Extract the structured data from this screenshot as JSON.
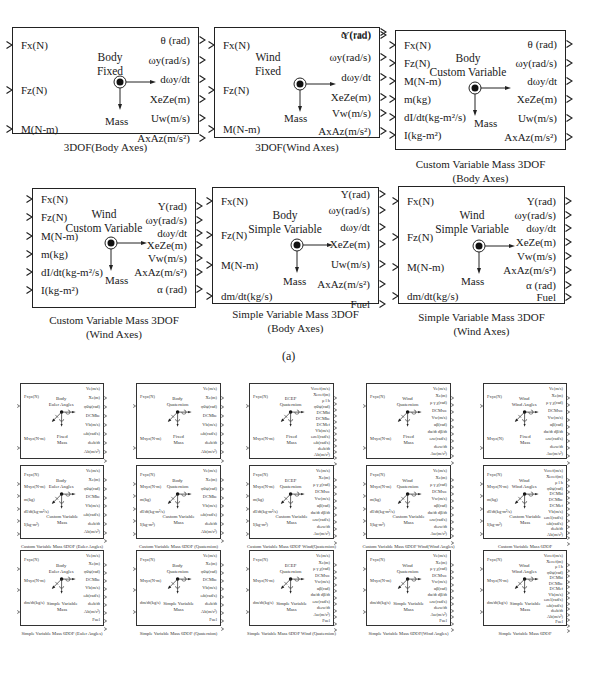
{
  "figure_label": "(a)",
  "blocks_3dof": [
    {
      "caption": [
        "3DOF(Body Axes)"
      ],
      "title": [
        "Body",
        "Fixed"
      ],
      "mass": "Mass",
      "inputs": [
        "Fx(N)",
        "Fz(N)",
        "M(N-m)"
      ],
      "outputs": [
        "θ (rad)",
        "ωy(rad/s)",
        "dωy/dt",
        "XeZe(m)",
        "Uw(m/s)",
        "AxAz(m/s²)"
      ]
    },
    {
      "caption": [
        "3DOF(Wind Axes)"
      ],
      "title": [
        "Wind",
        "Fixed"
      ],
      "mass": "Mass",
      "inputs": [
        "Fx(N)",
        "Fz(N)",
        "M(N-m)"
      ],
      "outputs": [
        "Y(rad)",
        "ωy(rad/s)",
        "dωy/dt",
        "XeZe(m)",
        "Vw(m/s)",
        "AxAz(m/s²)",
        "α (rad)"
      ]
    },
    {
      "caption": [
        "Custom Variable Mass 3DOF",
        "(Body Axes)"
      ],
      "title": [
        "Body",
        "Custom Variable"
      ],
      "mass": "Mass",
      "inputs": [
        "Fx(N)",
        "Fz(N)",
        "M(N-m)",
        "m(kg)",
        "dI/dt(kg-m²/s)",
        "I(kg-m²)"
      ],
      "outputs": [
        "θ (rad)",
        "ωy(rad/s)",
        "dωy/dt",
        "XeZe(m)",
        "Uw(m/s)",
        "AxAz(m/s²)"
      ]
    },
    {
      "caption": [
        "Custom Variable Mass 3DOF",
        "(Wind Axes)"
      ],
      "title": [
        "Wind",
        "Custom Variable"
      ],
      "mass": "Mass",
      "inputs": [
        "Fx(N)",
        "Fz(N)",
        "M(N-m)",
        "m(kg)",
        "dI/dt(kg-m²/s)",
        "I(kg-m²)"
      ],
      "outputs": [
        "Y(rad)",
        "ωy(rad/s)",
        "dωy/dt",
        "XeZe(m)",
        "Vw(m/s)",
        "AxAz(m/s²)",
        "α (rad)"
      ]
    },
    {
      "caption": [
        "Simple  Variable Mass 3DOF",
        "(Body Axes)"
      ],
      "title": [
        "Body",
        "Simple  Variable"
      ],
      "mass": "Mass",
      "inputs": [
        "Fx(N)",
        "Fz(N)",
        "M(N-m)",
        "dm/dt(kg/s)"
      ],
      "outputs": [
        "Y(rad)",
        "ωy(rad/s)",
        "dωy/dt",
        "XeZe(m)",
        "Uw(m/s)",
        "AxAz(m/s²)",
        "Fuel"
      ]
    },
    {
      "caption": [
        "Simple  Variable Mass 3DOF",
        "(Wind Axes)"
      ],
      "title": [
        "Wind",
        "Simple  Variable"
      ],
      "mass": "Mass",
      "inputs": [
        "Fx(N)",
        "Fz(N)",
        "M(N-m)",
        "dm/dt(kg/s)"
      ],
      "outputs": [
        "Y(rad)",
        "ωy(rad/s)",
        "dωy/dt",
        "XeZe(m)",
        "Vw(m/s)",
        "AxAz(m/s²)",
        "α (rad)",
        "Fuel"
      ]
    }
  ],
  "blocks_6dof": [
    {
      "caption": "6DOF(Euler Angles)",
      "title": [
        "Body",
        "Euler Angles"
      ],
      "mass": [
        "Fixed",
        "Mass"
      ],
      "inputs": [
        "Fxyz(N)",
        "Mxyz(N-m)"
      ],
      "outputs": [
        "Ve(m/s)",
        "Xe(m)",
        "φθψ(rad)",
        "DCMbe",
        "Vb(m/s)",
        "ωb(rad/s)",
        "dωb/dt",
        "Ab(m/s²)"
      ]
    },
    {
      "caption": "6DOF(Quaternion)",
      "title": [
        "Body",
        "Quaternion"
      ],
      "mass": [
        "Fixed",
        "Mass"
      ],
      "inputs": [
        "Fxyz(N)",
        "Mxyz(N-m)"
      ],
      "outputs": [
        "Ve(m/s)",
        "Xe(m)",
        "φθψ(rad)",
        "DCMbe",
        "Vb(m/s)",
        "ωb(rad/s)",
        "dωb/dt",
        "Ab(m/s²)"
      ]
    },
    {
      "caption": "6DOF ECEF(Quaternion)",
      "title": [
        "ECEF",
        "Quaternion"
      ],
      "mass": [
        "Fixed",
        "Mass"
      ],
      "inputs": [
        "Fxyz(N)",
        "Mxyz(N-m)"
      ],
      "outputs": [
        "Vecef(m/s)",
        "Xecef(m)",
        "μ l h",
        "φθψ(rad)",
        "DCMbi",
        "DCMbe",
        "DCMef",
        "Vb(m/s)",
        "ωrel(rad/s)",
        "ωb(rad/s)",
        "dωb/dt",
        "Ab(m/s²)"
      ]
    },
    {
      "caption": "6DOF Wind(Quaternion)",
      "title": [
        "Wind",
        "Quaternion"
      ],
      "mass": [
        "Fixed",
        "Mass"
      ],
      "inputs": [
        "Fxyz(N)",
        "Mxyz(N-m)"
      ],
      "outputs": [
        "Ve(m/s)",
        "Xe(m)",
        "μ γ χ(rad)",
        "DCMwe",
        "Vw(m/s)",
        "αβ(rad)",
        "dα/dt dβ/dt",
        "ωw(rad/s)",
        "dωw/dt",
        "Aw(m/s²)"
      ]
    },
    {
      "caption": "6DOF Wind(Wind Angles)",
      "title": [
        "Wind",
        "Wind Angles"
      ],
      "mass": [
        "Fixed",
        "Mass"
      ],
      "inputs": [
        "Fxyz(N)",
        "Mxyz(N)"
      ],
      "outputs": [
        "Ve(m/s)",
        "Xe(m)",
        "μ γ χ(rad)",
        "DCMwe",
        "Vw(m/s)",
        "αβ(rad)",
        "dα/dt dβ/dt",
        "ωw(rad/s)",
        "dωw/dt",
        "Aw(m/s²)"
      ]
    },
    {
      "caption": "Custom Variable Mass 6DOF (Euler Angles)",
      "title": [
        "Body",
        "Euler Angles"
      ],
      "mass": [
        "Custom Variable",
        "Mass"
      ],
      "inputs": [
        "Fxyz(N)",
        "Mxyz(N-m)",
        "m(kg)",
        "dI/dt(kg-m²/s)",
        "I(kg-m²)"
      ],
      "outputs": [
        "Ve(m/s)",
        "Xe(m)",
        "φθψ(rad)",
        "DCMbe",
        "Vb(m/s)",
        "ωb(rad/s)",
        "dωb/dt",
        "Ab(m/s²)"
      ]
    },
    {
      "caption": "Custom Variable Mass 6DOF (Quaternion)",
      "title": [
        "Body",
        "Quaternion"
      ],
      "mass": [
        "Custom Variable",
        "Mass"
      ],
      "inputs": [
        "Fxyz(N)",
        "Mxyz(N-m)",
        "m(kg)",
        "dI/dt(kg-m²/s)",
        "I(kg-m²)"
      ],
      "outputs": [
        "Ve(m/s)",
        "Xe(m)",
        "φθψ(rad)",
        "DCMbe",
        "Vb(m/s)",
        "ωb(rad/s)",
        "dωb/dt",
        "Ab(m/s²)"
      ]
    },
    {
      "caption": "Custom Variable Mass 6DOF Wind(Quaternion)",
      "title": [
        "ECEF",
        "Quaternion"
      ],
      "mass": [
        "Custom Variable",
        "Mass"
      ],
      "inputs": [
        "Fxyz(N)",
        "Mxyz(N-m)",
        "m(kg)",
        "dI/dt(kg-m²/s)",
        "I(kg-m²)"
      ],
      "outputs": [
        "Ve(m/s)",
        "Xe(m)",
        "μ γ χ(rad)",
        "DCMwe",
        "Vw(m/s)",
        "αβ(rad)",
        "dα/dt dβ/dt",
        "ωw(rad/s)",
        "dωw/dt",
        "Aw(m/s²)"
      ]
    },
    {
      "caption": "Custom Variable Mass 6DOF Wind(Wind Angles)",
      "title": [
        "Wind",
        "Quaternion"
      ],
      "mass": [
        "Custom Variable",
        "Mass"
      ],
      "inputs": [
        "Fxyz(N)",
        "Mxyz(N-m)",
        "m(kg)",
        "dI/dt(kg-m²/s)",
        "I(kg-m²)"
      ],
      "outputs": [
        "Ve(m/s)",
        "Xe(m)",
        "μ γ χ(rad)",
        "DCMwe",
        "Vw(m/s)",
        "αβ(rad)",
        "dα/dt dβ/dt",
        "ωw(rad/s)",
        "dωw/dt",
        "Aw(m/s²)"
      ]
    },
    {
      "caption": "Custom Variable Mass 6DOF",
      "title": [
        "Wind",
        "Wind Angles"
      ],
      "mass": [
        "Custom Variable",
        "Mass"
      ],
      "inputs": [
        "Fxyz(N)",
        "Mxyz(N-m)",
        "m(kg)",
        "dI/dt(kg-m²/s)",
        "I(kg-m²)"
      ],
      "outputs": [
        "Vecef(m/s)",
        "Xecef(m)",
        "μ l h",
        "φθψ(rad)",
        "DCMbi",
        "DCMbe",
        "DCMef",
        "Vb(m/s)",
        "ωrel(rad/s)",
        "ωb(rad/s)",
        "dωb/dt",
        "Ab(m/s²)"
      ]
    },
    {
      "caption": "Simple Variable Mass 6DOF (Euler Angles)",
      "title": [
        "Body",
        "Euler Angles"
      ],
      "mass": [
        "Simple Variable",
        "Mass"
      ],
      "inputs": [
        "Fxyz(N)",
        "Mxyz(N-m)",
        "dm/dt(kg/s)"
      ],
      "outputs": [
        "Ve(m/s)",
        "Xe(m)",
        "φθψ(rad)",
        "DCMbe",
        "Vb(m/s)",
        "ωb(rad/s)",
        "dωb/dt",
        "Ab(m/s²)",
        "Fuel"
      ]
    },
    {
      "caption": "Simple Variable Mass 6DOF (Quaternion)",
      "title": [
        "Body",
        "Quaternion"
      ],
      "mass": [
        "Simple Variable",
        "Mass"
      ],
      "inputs": [
        "Fxyz(N)",
        "Mxyz(N-m)",
        "dm/dt(kg/s)"
      ],
      "outputs": [
        "Ve(m/s)",
        "Xe(m)",
        "φθψ(rad)",
        "DCMbe",
        "Vb(m/s)",
        "ωb(rad/s)",
        "dωb/dt",
        "Ab(m/s²)",
        "Fuel"
      ]
    },
    {
      "caption": "Simple Variable Mass 6DOF Wind (Quaternion)",
      "title": [
        "ECEF",
        "Quaternion"
      ],
      "mass": [
        "Simple Variable",
        "Mass"
      ],
      "inputs": [
        "Fxyz(N)",
        "Mxyz(N-m)",
        "dm/dt(kg/s)"
      ],
      "outputs": [
        "Ve(m/s)",
        "Xe(m)",
        "μ γ χ(rad)",
        "DCMwe",
        "Vw(m/s)",
        "αβ(rad)",
        "dα/dt dβ/dt",
        "ωw(rad/s)",
        "dωw/dt",
        "Aw(m/s²)",
        "Fuel"
      ]
    },
    {
      "caption": "Simple Variable Mass 6DOF(Wind Angles)",
      "title": [
        "Wind",
        "Quaternion"
      ],
      "mass": [
        "Simple Variable",
        "Mass"
      ],
      "inputs": [
        "Fxyz(N)",
        "Mxyz(N-m)",
        "dm/dt(kg/s)"
      ],
      "outputs": [
        "Ve(m/s)",
        "Xe(m)",
        "μ γ χ(rad)",
        "DCMwe",
        "Vw(m/s)",
        "αβ(rad)",
        "dα/dt dβ/dt",
        "ωw(rad/s)",
        "dωw/dt",
        "Aw(m/s²)",
        "Fuel"
      ]
    },
    {
      "caption": "Simple Variable Mass 6DOF",
      "title": [
        "Wind",
        "Wind Angles"
      ],
      "mass": [
        "Simple Variable",
        "Mass"
      ],
      "inputs": [
        "Fxyz(N)",
        "Mxyz(N-m)",
        "dm/dt(kg/s)"
      ],
      "outputs": [
        "Vecef(m/s)",
        "Xecef(m)",
        "μ l h",
        "φθψ(rad)",
        "DCMbi",
        "DCMbe",
        "DCMef",
        "Vb(m/s)",
        "ωrel(rad/s)",
        "ωb(rad/s)",
        "dωb/dt",
        "Ab(m/s²)",
        "Fuel"
      ]
    }
  ]
}
